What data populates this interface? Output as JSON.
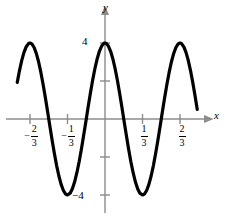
{
  "chart_data": {
    "type": "line",
    "title": "",
    "xlabel": "x",
    "ylabel": "y",
    "function": "y = 4 cos(6πx)",
    "amplitude": 4,
    "period": 0.6667,
    "xlim": [
      -0.78,
      0.82
    ],
    "ylim": [
      -5.2,
      5.2
    ],
    "grid": false,
    "legend": null,
    "x_tick_labels": [
      "-2/3",
      "-1/3",
      "1/3",
      "2/3"
    ],
    "x_tick_values": [
      -0.6667,
      -0.3333,
      0.3333,
      0.6667
    ],
    "y_tick_labels": [
      "4",
      "-4"
    ],
    "y_tick_values": [
      4,
      -4
    ],
    "y_minor_tick_values": [
      2,
      -2
    ],
    "series": [
      {
        "name": "y = 4 cos(6πx)",
        "color": "#000000",
        "x": [
          -0.78,
          -0.76,
          -0.74,
          -0.72,
          -0.7,
          -0.68,
          -0.6667,
          -0.65,
          -0.63,
          -0.61,
          -0.59,
          -0.57,
          -0.55,
          -0.53,
          -0.51,
          -0.49,
          -0.47,
          -0.45,
          -0.43,
          -0.41,
          -0.39,
          -0.37,
          -0.35,
          -0.3333,
          -0.31,
          -0.29,
          -0.27,
          -0.25,
          -0.23,
          -0.21,
          -0.19,
          -0.17,
          -0.15,
          -0.13,
          -0.11,
          -0.09,
          -0.07,
          -0.05,
          -0.03,
          -0.01,
          0.0,
          0.01,
          0.03,
          0.05,
          0.07,
          0.09,
          0.11,
          0.13,
          0.15,
          0.17,
          0.19,
          0.21,
          0.23,
          0.25,
          0.27,
          0.29,
          0.31,
          0.3333,
          0.35,
          0.37,
          0.39,
          0.41,
          0.43,
          0.45,
          0.47,
          0.49,
          0.51,
          0.53,
          0.55,
          0.57,
          0.59,
          0.61,
          0.63,
          0.65,
          0.6667,
          0.68,
          0.7,
          0.72,
          0.74,
          0.76,
          0.78,
          0.8,
          0.82
        ],
        "y_formula": "4*cos(6*pi*x)",
        "peaks_x": [
          -0.6667,
          0,
          0.6667
        ],
        "peaks_y": [
          4,
          4,
          4
        ],
        "troughs_x": [
          -0.3333,
          0.3333
        ],
        "troughs_y": [
          -4,
          -4
        ],
        "zero_crossings_x": [
          -0.8333,
          -0.5,
          -0.1667,
          0.1667,
          0.5,
          0.8333
        ]
      }
    ],
    "axes": {
      "x_axis_color": "#8c8c8c",
      "y_axis_color": "#8c8c8c",
      "curve_color": "#000000",
      "curve_width": 3.2,
      "x_arrow": true,
      "y_arrow": true
    }
  },
  "labels": {
    "y_axis_letter": "y",
    "x_axis_letter": "x",
    "y_top": "4",
    "y_bottom": "−4",
    "x_neg_two_thirds": {
      "sign": "−",
      "numerator": "2",
      "denominator": "3"
    },
    "x_neg_one_third": {
      "sign": "−",
      "numerator": "1",
      "denominator": "3"
    },
    "x_pos_one_third": {
      "sign": "",
      "numerator": "1",
      "denominator": "3"
    },
    "x_pos_two_thirds": {
      "sign": "",
      "numerator": "2",
      "denominator": "3"
    }
  }
}
